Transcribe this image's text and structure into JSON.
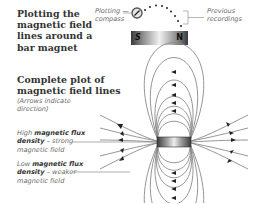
{
  "title_top": [
    "Plotting the",
    "magnetic field",
    "lines around a",
    "bar magnet"
  ],
  "top_diagram": {
    "compass_label": [
      "Plotting —",
      "compass"
    ],
    "recordings_label": [
      "Previous",
      "recordings"
    ],
    "magnet_left_pole": "S",
    "magnet_right_pole": "N"
  },
  "title_bottom": [
    "Complete plot of",
    "magnetic field lines"
  ],
  "subtitle_bottom": [
    "(Arrows indicate",
    "direction)"
  ],
  "annotations": {
    "high": {
      "pre": "High ",
      "bold1": "magnetic flux",
      "bold2": "density",
      "post": " – strong",
      "line3": "magnetic field"
    },
    "low": {
      "pre": "Low ",
      "bold1": "magnetic flux",
      "bold2": "density",
      "post": " – weaker",
      "line3": "magnetic field"
    }
  },
  "colors": {
    "field_line": "#8a8a8a",
    "arrow": "#222222",
    "text": "#333333",
    "label": "#6a6a6a"
  }
}
